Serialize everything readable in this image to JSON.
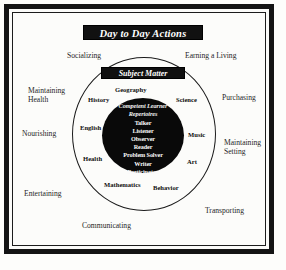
{
  "figure": {
    "title_banner": "Day to Day Actions",
    "subject_banner": "Subject  Matter"
  },
  "outer_ring": {
    "name": "Day to Day Actions",
    "labels": [
      {
        "id": "socializing",
        "text": "Socializing"
      },
      {
        "id": "earning-a-living",
        "text": "Earning a Living"
      },
      {
        "id": "maintaining-health",
        "line1": "Maintaining",
        "line2": "Health"
      },
      {
        "id": "purchasing",
        "text": "Purchasing"
      },
      {
        "id": "nourishing",
        "text": "Nourishing"
      },
      {
        "id": "maintaining-setting",
        "line1": "Maintaining",
        "line2": "Setting"
      },
      {
        "id": "entertaining",
        "text": "Entertaining"
      },
      {
        "id": "transporting",
        "text": "Transporting"
      },
      {
        "id": "communicating",
        "text": "Communicating"
      }
    ]
  },
  "middle_ring": {
    "name": "Subject Matter",
    "labels": [
      {
        "id": "geography",
        "text": "Geography"
      },
      {
        "id": "history",
        "text": "History"
      },
      {
        "id": "science",
        "text": "Science"
      },
      {
        "id": "english",
        "text": "English"
      },
      {
        "id": "music",
        "text": "Music"
      },
      {
        "id": "health",
        "text": "Health"
      },
      {
        "id": "art",
        "text": "Art"
      },
      {
        "id": "mathematics",
        "text": "Mathematics"
      },
      {
        "id": "behavior",
        "text": "Behavior"
      }
    ]
  },
  "inner_circle": {
    "heading_line1": "Competent Learner",
    "heading_line2": "Repertoires",
    "items": [
      "Talker",
      "Listener",
      "Observer",
      "Reader",
      "Problem Solver",
      "Writer",
      "Participator"
    ]
  },
  "colors": {
    "ink": "#141414",
    "paper": "#fcfcfa",
    "banner_bg": "#111111",
    "banner_text": "#ffffff",
    "inner_circle_fill": "#090909"
  }
}
